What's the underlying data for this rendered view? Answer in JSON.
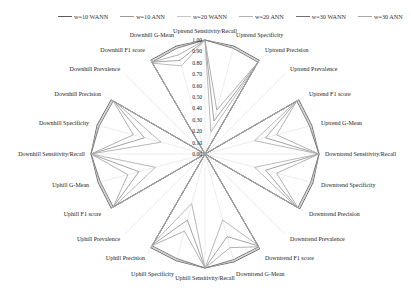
{
  "chart_data": {
    "type": "radar",
    "title": "",
    "radial_ticks": [
      "0.00",
      "0.10",
      "0.20",
      "0.30",
      "0.40",
      "0.50",
      "0.60",
      "0.70",
      "0.80",
      "0.90",
      "1.00"
    ],
    "rlim": [
      0,
      1
    ],
    "legend_position": "top",
    "categories": [
      "Uptrend Sensitivity/Recall",
      "Uptrend Specificity",
      "Uptrend Precision",
      "Uptrend Prevalence",
      "Uptrend F1 score",
      "Uptrend G-Mean",
      "Downtrend Sensitivity/Recall",
      "Downtrend Specificity",
      "Downtrend Precision",
      "Downtrend Prevalence",
      "Downtrend F1 score",
      "Downtrend G-Mean",
      "Uphill Sensitivity/Recall",
      "Uphill Specificity",
      "Uphill Precision",
      "Uphill Prevalence",
      "Uphill F1 score",
      "Uphill G-Mean",
      "Downhill Sensitivity/Recall",
      "Downhill Specificity",
      "Downhill Precision",
      "Downhill Prevalence",
      "Downhill F1 score",
      "Downhill G-Mean"
    ],
    "series": [
      {
        "name": "w=10 WANN",
        "color": "#5a5a5a",
        "values": [
          1.0,
          0.98,
          0.95,
          0.0,
          0.95,
          0.97,
          1.0,
          0.98,
          0.96,
          0.0,
          0.96,
          0.98,
          1.0,
          0.97,
          0.95,
          0.0,
          0.95,
          0.97,
          1.0,
          0.98,
          0.95,
          0.0,
          0.95,
          0.98
        ]
      },
      {
        "name": "w=10 ANN",
        "color": "#9a9a9a",
        "values": [
          1.0,
          0.3,
          0.92,
          0.0,
          0.93,
          0.55,
          1.0,
          0.55,
          0.93,
          0.0,
          0.93,
          0.75,
          1.0,
          0.6,
          0.92,
          0.0,
          0.93,
          0.6,
          1.0,
          0.55,
          0.92,
          0.0,
          0.93,
          0.85
        ]
      },
      {
        "name": "w=20 WANN",
        "color": "#c4c4c4",
        "values": [
          1.0,
          0.97,
          0.94,
          0.0,
          0.94,
          0.96,
          1.0,
          0.97,
          0.95,
          0.0,
          0.95,
          0.97,
          1.0,
          0.96,
          0.94,
          0.0,
          0.94,
          0.96,
          1.0,
          0.97,
          0.94,
          0.0,
          0.94,
          0.97
        ]
      },
      {
        "name": "w=20 ANN",
        "color": "#b0b0b0",
        "values": [
          1.0,
          0.2,
          0.9,
          0.0,
          0.92,
          0.45,
          1.0,
          0.45,
          0.92,
          0.0,
          0.92,
          0.6,
          1.0,
          0.45,
          0.9,
          0.0,
          0.92,
          0.45,
          1.0,
          0.4,
          0.9,
          0.0,
          0.92,
          0.8
        ]
      },
      {
        "name": "w=30 WANN",
        "color": "#707070",
        "values": [
          1.0,
          0.96,
          0.93,
          0.0,
          0.93,
          0.95,
          1.0,
          0.96,
          0.94,
          0.0,
          0.94,
          0.96,
          1.0,
          0.95,
          0.93,
          0.0,
          0.93,
          0.95,
          1.0,
          0.96,
          0.93,
          0.0,
          0.93,
          0.96
        ]
      },
      {
        "name": "w=30 ANN",
        "color": "#a8a8a8",
        "values": [
          1.0,
          0.4,
          0.93,
          0.0,
          0.93,
          0.65,
          1.0,
          0.65,
          0.94,
          0.0,
          0.94,
          0.85,
          1.0,
          0.7,
          0.93,
          0.0,
          0.93,
          0.7,
          1.0,
          0.65,
          0.93,
          0.0,
          0.93,
          0.9
        ]
      }
    ]
  },
  "legend": {
    "items": [
      "w=10 WANN",
      "w=10 ANN",
      "w=20 WANN",
      "w=20 ANN",
      "w=30 WANN",
      "w=30 ANN"
    ]
  }
}
